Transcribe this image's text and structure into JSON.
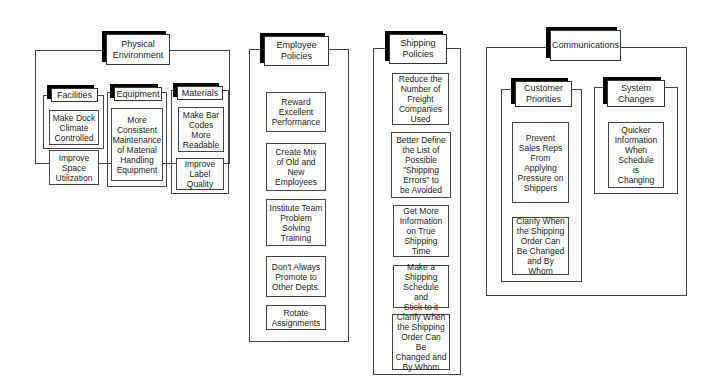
{
  "categories": [
    {
      "title": "Physical\nEnvironment",
      "subgroups": [
        {
          "title": "Facilities",
          "items": [
            "Make Dock\nClimate\nControlled",
            "Improve\nSpace\nUtilization"
          ]
        },
        {
          "title": "Equipment",
          "items": [
            "More\nConsistent\nMaintenance\nof Material\nHandling\nEquipment"
          ]
        },
        {
          "title": "Materials",
          "items": [
            "Make Bar\nCodes\nMore\nReadable",
            "Improve\nLabel\nQuality"
          ]
        }
      ]
    },
    {
      "title": "Employee\nPolicies",
      "items": [
        "Reward\nExcellent\nPerformance",
        "Create Mix\nof Old and\nNew\nEmployees",
        "Institute Team\nProblem\nSolving\nTraining",
        "Don't Always\nPromote to\nOther Depts.",
        "Rotate\nAssignments"
      ]
    },
    {
      "title": "Shipping\nPolicies",
      "items": [
        "Reduce the\nNumber of\nFreight\nCompanies\nUsed",
        "Better Define\nthe List of\nPossible\n\"Shipping\nErrors\" to\nbe Avoided",
        "Get More\nInformation\non True\nShipping\nTime",
        "Make a\nShipping\nSchedule and\nStick to it",
        "Clarify When\nthe Shipping\nOrder Can Be\nChanged and\nBy Whom"
      ]
    },
    {
      "title": "Communications",
      "subgroups": [
        {
          "title": "Customer\nPriorities",
          "items": [
            "Prevent\nSales Reps\nFrom\nApplying\nPressure on\nShippers",
            "Clarify When\nthe Shipping\nOrder Can\nBe Changed\nand By Whom"
          ]
        },
        {
          "title": "System\nChanges",
          "items": [
            "Quicker\nInformation\nWhen\nSchedule\nis\nChanging"
          ]
        }
      ]
    }
  ]
}
